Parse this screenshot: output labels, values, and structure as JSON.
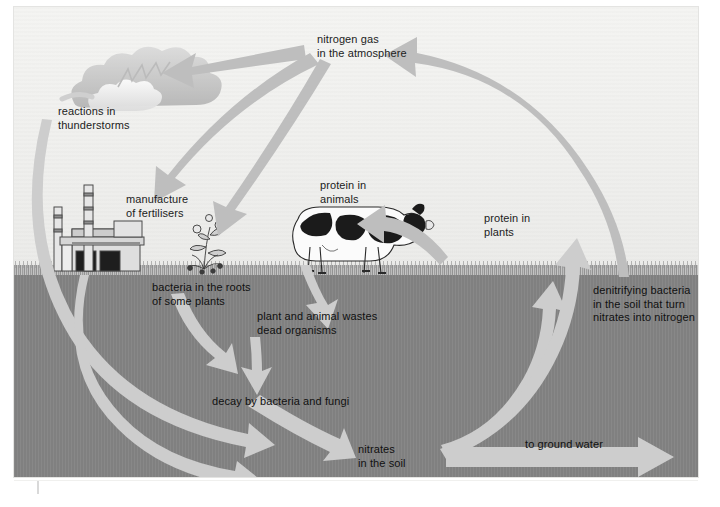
{
  "figure": {
    "colors": {
      "sky": "#f1f1ef",
      "soil": "#848484",
      "grass": "#9a9a9a",
      "arrow_sky": "#bdbdbd",
      "arrow_soil": "#c9c9c9",
      "text": "#1c1c1c"
    }
  },
  "labels": [
    {
      "id": "nitrogen-gas",
      "text": "nitrogen gas\nin the atmosphere"
    },
    {
      "id": "reactions",
      "text": "reactions in\nthunderstorms"
    },
    {
      "id": "fertilisers",
      "text": "manufacture\nof fertilisers"
    },
    {
      "id": "protein-animals",
      "text": "protein in\nanimals"
    },
    {
      "id": "protein-plants",
      "text": "protein in\nplants"
    },
    {
      "id": "root-bacteria",
      "text": "bacteria in the roots\nof some plants"
    },
    {
      "id": "wastes",
      "text": "plant and animal wastes\ndead organisms"
    },
    {
      "id": "denitrifying",
      "text": "denitrifying bacteria\nin the soil that turn\nnitrates into nitrogen"
    },
    {
      "id": "decay",
      "text": "decay by bacteria and fungi"
    },
    {
      "id": "nitrates",
      "text": "nitrates\nin the soil"
    },
    {
      "id": "ground-water",
      "text": "to ground water"
    }
  ],
  "illustrations": [
    {
      "id": "thundercloud",
      "name": "cloud-with-lightning-illustration"
    },
    {
      "id": "factory",
      "name": "chemical-factory-illustration"
    },
    {
      "id": "plant",
      "name": "legume-plant-illustration"
    },
    {
      "id": "cow",
      "name": "cow-illustration"
    }
  ],
  "flows": [
    {
      "id": "atmosphere-to-thunderstorm",
      "from": "nitrogen gas in the atmosphere",
      "to": "reactions in thunderstorms"
    },
    {
      "id": "atmosphere-to-fertilisers",
      "from": "nitrogen gas in the atmosphere",
      "to": "manufacture of fertilisers"
    },
    {
      "id": "atmosphere-to-roots",
      "from": "nitrogen gas in the atmosphere",
      "to": "bacteria in the roots of some plants"
    },
    {
      "id": "thunderstorm-to-nitrates",
      "from": "reactions in thunderstorms",
      "to": "nitrates in the soil"
    },
    {
      "id": "fertilisers-to-nitrates",
      "from": "manufacture of fertilisers",
      "to": "nitrates in the soil"
    },
    {
      "id": "roots-to-decay",
      "from": "bacteria in the roots of some plants",
      "to": "decay by bacteria and fungi"
    },
    {
      "id": "animals-to-wastes",
      "from": "protein in animals",
      "to": "plant and animal wastes dead organisms"
    },
    {
      "id": "wastes-to-decay",
      "from": "plant and animal wastes",
      "to": "decay by bacteria and fungi"
    },
    {
      "id": "decay-to-nitrates",
      "from": "decay by bacteria and fungi",
      "to": "nitrates in the soil"
    },
    {
      "id": "plants-to-animals",
      "from": "protein in plants",
      "to": "protein in animals"
    },
    {
      "id": "nitrates-to-denitrifying",
      "from": "nitrates in the soil",
      "to": "denitrifying bacteria in the soil"
    },
    {
      "id": "nitrates-to-plants",
      "from": "nitrates in the soil",
      "to": "protein in plants"
    },
    {
      "id": "nitrates-to-ground-water",
      "from": "nitrates in the soil",
      "to": "to ground water"
    },
    {
      "id": "denitrifying-to-atmosphere",
      "from": "denitrifying bacteria",
      "to": "nitrogen gas in the atmosphere"
    }
  ]
}
